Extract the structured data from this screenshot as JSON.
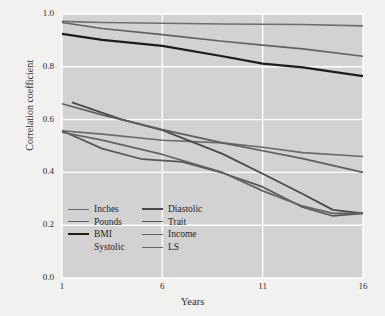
{
  "chart_data": {
    "type": "line",
    "title": "",
    "xlabel": "Years",
    "ylabel": "Correlation coefficient",
    "xlim": [
      1,
      16
    ],
    "ylim": [
      0.0,
      1.0
    ],
    "xticks": [
      1,
      6,
      11,
      16
    ],
    "yticks": [
      "0.0",
      "0.2",
      "0.4",
      "0.6",
      "0.8",
      "1.0"
    ],
    "ytick_values": [
      0.0,
      0.2,
      0.4,
      0.6,
      0.8,
      1.0
    ],
    "grid": true,
    "legend_position": "inside lower-left",
    "plot_background": "#d2d2d2",
    "figure_background": "#f1f1ef",
    "gridline_color": "#ffffff",
    "series": [
      {
        "name": "Inches",
        "color": "#6e6e6e",
        "width": 1.6,
        "x": [
          1,
          3,
          6,
          9,
          11,
          13,
          16
        ],
        "values": [
          0.972,
          0.968,
          0.965,
          0.962,
          0.961,
          0.96,
          0.955
        ]
      },
      {
        "name": "Pounds",
        "color": "#616161",
        "width": 1.6,
        "x": [
          1,
          3,
          6,
          9,
          11,
          13,
          16
        ],
        "values": [
          0.968,
          0.945,
          0.922,
          0.897,
          0.882,
          0.868,
          0.84
        ]
      },
      {
        "name": "BMI",
        "color": "#1c1c1c",
        "width": 2.2,
        "x": [
          1,
          3,
          6,
          9,
          11,
          13,
          16
        ],
        "values": [
          0.925,
          0.902,
          0.879,
          0.84,
          0.812,
          0.798,
          0.765
        ]
      },
      {
        "name": "Systolic",
        "color": "#6a6a6a",
        "width": 1.6,
        "x": [
          1,
          3,
          6,
          9,
          11,
          13,
          16
        ],
        "values": [
          0.558,
          0.545,
          0.522,
          0.512,
          0.495,
          0.475,
          0.46
        ]
      },
      {
        "name": "Diastolic",
        "color": "#4a4a4a",
        "width": 1.8,
        "x": [
          1.5,
          4,
          6,
          9,
          11,
          13,
          14.5,
          16
        ],
        "values": [
          0.665,
          0.6,
          0.56,
          0.47,
          0.395,
          0.318,
          0.258,
          0.245
        ]
      },
      {
        "name": "Trait",
        "color": "#575757",
        "width": 1.7,
        "x": [
          1,
          3,
          5,
          7,
          9,
          11,
          13,
          14.5,
          16
        ],
        "values": [
          0.558,
          0.49,
          0.45,
          0.44,
          0.398,
          0.345,
          0.268,
          0.235,
          0.245
        ]
      },
      {
        "name": "Income",
        "color": "#5e5e5e",
        "width": 1.7,
        "x": [
          1,
          3,
          6,
          9,
          11,
          13,
          16
        ],
        "values": [
          0.66,
          0.618,
          0.562,
          0.512,
          0.482,
          0.452,
          0.4
        ]
      },
      {
        "name": "LS",
        "color": "#636363",
        "width": 1.7,
        "x": [
          1,
          3,
          6,
          9,
          11,
          13,
          14.5,
          16
        ],
        "values": [
          0.552,
          0.522,
          0.468,
          0.4,
          0.33,
          0.272,
          0.245,
          0.245
        ]
      }
    ]
  },
  "legend": {
    "rows": [
      {
        "left": {
          "label": "Inches",
          "color": "#6e6e6e",
          "width": 1.8,
          "swatch": true
        },
        "right": {
          "label": "Diastolic",
          "color": "#4a4a4a",
          "width": 2.0,
          "swatch": true
        }
      },
      {
        "left": {
          "label": "Pounds",
          "color": "#616161",
          "width": 1.8,
          "swatch": true
        },
        "right": {
          "label": "Trait",
          "color": "#575757",
          "width": 1.8,
          "swatch": true
        }
      },
      {
        "left": {
          "label": "BMI",
          "color": "#1c1c1c",
          "width": 2.4,
          "swatch": true
        },
        "right": {
          "label": "Income",
          "color": "#5e5e5e",
          "width": 1.8,
          "swatch": true
        }
      },
      {
        "left": {
          "label": "Systolic",
          "color": "#6a6a6a",
          "width": 1.8,
          "swatch": false
        },
        "right": {
          "label": "LS",
          "color": "#636363",
          "width": 1.8,
          "swatch": true
        }
      }
    ]
  }
}
